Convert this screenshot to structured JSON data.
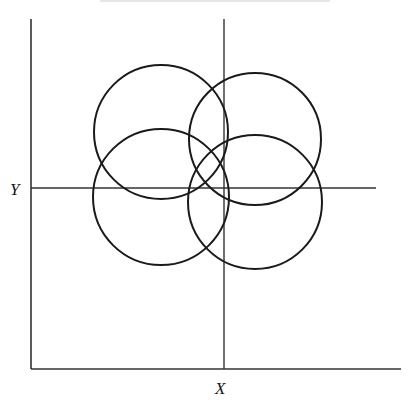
{
  "figure": {
    "type": "coordinate-frame-with-overlapping-circles",
    "frame": {
      "left": 31,
      "top": 19,
      "right": 401,
      "bottom": 369,
      "stroke": "#222222"
    },
    "axes": {
      "x_axis_vertical_line": {
        "x": 224,
        "y1": 19,
        "y2": 369
      },
      "y_axis_horizontal_line": {
        "y": 188,
        "x1": 31,
        "x2": 376
      }
    },
    "labels": {
      "x": "X",
      "y": "Y"
    },
    "circles": [
      {
        "name": "top-left",
        "cx": 161,
        "cy": 132,
        "r": 67
      },
      {
        "name": "top-right",
        "cx": 255,
        "cy": 139,
        "r": 66
      },
      {
        "name": "bottom-left",
        "cx": 161,
        "cy": 197,
        "r": 68
      },
      {
        "name": "bottom-right",
        "cx": 255,
        "cy": 202,
        "r": 67
      }
    ],
    "stroke_color": "#1a1a1a"
  }
}
